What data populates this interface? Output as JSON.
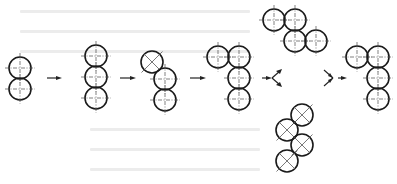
{
  "diagram": {
    "title": "",
    "colors": {
      "stroke": "#1a1a1a",
      "centerline": "#4a4a4a",
      "background": "#ffffff",
      "ghost_text": "#ececec"
    },
    "circle_radius": 11,
    "groups": [
      {
        "id": "g1",
        "label": "two-stack",
        "circles": [
          {
            "cx": 20,
            "cy": 68,
            "type": "cross"
          },
          {
            "cx": 20,
            "cy": 89,
            "type": "cross"
          }
        ]
      },
      {
        "id": "g2",
        "label": "three-stack",
        "circles": [
          {
            "cx": 96,
            "cy": 56,
            "type": "cross"
          },
          {
            "cx": 96,
            "cy": 77,
            "type": "cross"
          },
          {
            "cx": 96,
            "cy": 98,
            "type": "cross"
          }
        ]
      },
      {
        "id": "g3",
        "label": "top-shifted",
        "circles": [
          {
            "cx": 152,
            "cy": 62,
            "type": "x"
          },
          {
            "cx": 165,
            "cy": 79,
            "type": "cross"
          },
          {
            "cx": 165,
            "cy": 100,
            "type": "cross"
          }
        ]
      },
      {
        "id": "g4",
        "label": "L-shape",
        "circles": [
          {
            "cx": 218,
            "cy": 57,
            "type": "cross"
          },
          {
            "cx": 239,
            "cy": 57,
            "type": "cross"
          },
          {
            "cx": 239,
            "cy": 78,
            "type": "cross"
          },
          {
            "cx": 239,
            "cy": 99,
            "type": "cross"
          }
        ]
      },
      {
        "id": "g-top",
        "label": "zigzag-horizontal",
        "circles": [
          {
            "cx": 274,
            "cy": 20,
            "type": "cross"
          },
          {
            "cx": 295,
            "cy": 20,
            "type": "cross"
          },
          {
            "cx": 295,
            "cy": 41,
            "type": "cross"
          },
          {
            "cx": 316,
            "cy": 41,
            "type": "cross"
          }
        ]
      },
      {
        "id": "g-bottom",
        "label": "zigzag-diagonal",
        "circles": [
          {
            "cx": 302,
            "cy": 115,
            "type": "x"
          },
          {
            "cx": 287,
            "cy": 130,
            "type": "x"
          },
          {
            "cx": 302,
            "cy": 145,
            "type": "x"
          },
          {
            "cx": 287,
            "cy": 161,
            "type": "x"
          }
        ]
      },
      {
        "id": "g5",
        "label": "L-shape-final",
        "circles": [
          {
            "cx": 357,
            "cy": 57,
            "type": "cross"
          },
          {
            "cx": 378,
            "cy": 57,
            "type": "cross"
          },
          {
            "cx": 378,
            "cy": 78,
            "type": "cross"
          },
          {
            "cx": 378,
            "cy": 99,
            "type": "cross"
          }
        ]
      }
    ],
    "arrows": [
      {
        "x1": 47,
        "y1": 78,
        "x2": 62,
        "y2": 78
      },
      {
        "x1": 120,
        "y1": 78,
        "x2": 136,
        "y2": 78
      },
      {
        "x1": 190,
        "y1": 78,
        "x2": 206,
        "y2": 78
      },
      {
        "x1": 262,
        "y1": 78,
        "x2": 272,
        "y2": 78
      },
      {
        "x1": 338,
        "y1": 78,
        "x2": 347,
        "y2": 78
      }
    ],
    "branch_arrows": [
      {
        "id": "split",
        "x": 272,
        "y": 78,
        "dir": "out"
      },
      {
        "id": "merge",
        "x": 333,
        "y": 78,
        "dir": "in"
      }
    ]
  }
}
